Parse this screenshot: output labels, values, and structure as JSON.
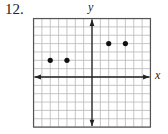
{
  "problem_number": "12.",
  "chart_data": {
    "type": "scatter",
    "title": "",
    "xlabel": "x",
    "ylabel": "y",
    "xlim": [
      -7,
      7
    ],
    "ylim": [
      -6,
      7
    ],
    "grid": true,
    "tick_labels": false,
    "points": [
      {
        "x": -5,
        "y": 2
      },
      {
        "x": -3,
        "y": 2
      },
      {
        "x": 2,
        "y": 4
      },
      {
        "x": 4,
        "y": 4
      }
    ]
  }
}
